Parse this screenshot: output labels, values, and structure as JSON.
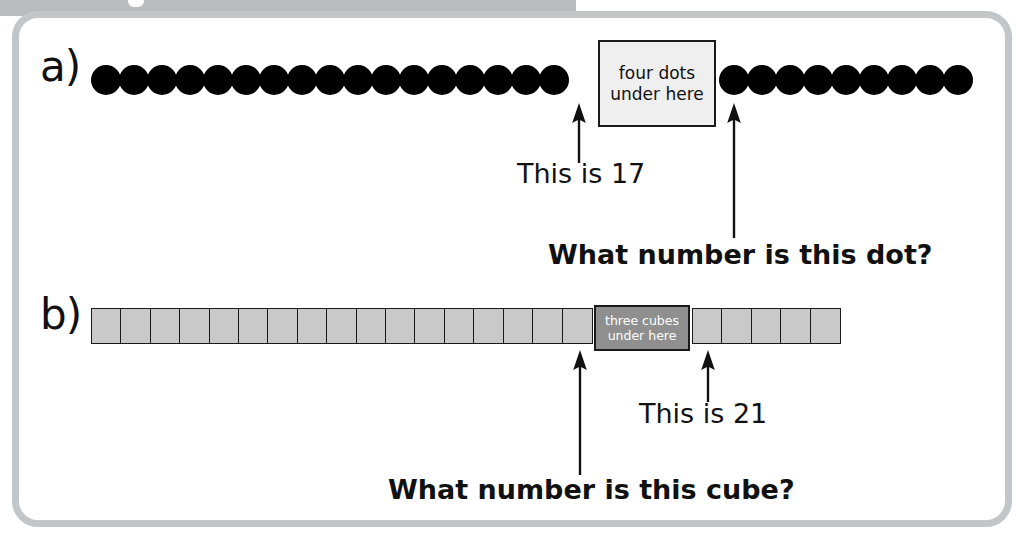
{
  "page": {
    "background_color": "#ffffff",
    "frame_border_color": "#c3c6c8",
    "top_band_color": "#b9bcbe"
  },
  "parts": {
    "a": {
      "label": "a)",
      "manipulative": "dots",
      "dot_color": "#000000",
      "dots_before_cover": 17,
      "dots_after_cover": 9,
      "cover": {
        "line1": "four dots",
        "line2": "under here",
        "hidden_count": 4,
        "fill_color": "#efefef",
        "text_color": "#111111"
      },
      "annotations": [
        {
          "name": "known-marker",
          "text": "This is 17",
          "value": 17,
          "bold": false
        },
        {
          "name": "question",
          "text": "What number is this dot?",
          "bold": true
        }
      ]
    },
    "b": {
      "label": "b)",
      "manipulative": "cubes",
      "cube_fill_color": "#c9c9c9",
      "cube_border_color": "#1a1a1a",
      "cubes_before_cover": 17,
      "cubes_after_cover": 5,
      "cover": {
        "line1": "three cubes",
        "line2": "under here",
        "hidden_count": 3,
        "fill_color": "#8f8f8f",
        "text_color": "#ffffff"
      },
      "annotations": [
        {
          "name": "known-marker",
          "text": "This is 21",
          "value": 21,
          "bold": false
        },
        {
          "name": "question",
          "text": "What number is this cube?",
          "bold": true
        }
      ]
    }
  },
  "icons": {
    "arrow_up": "arrow-up-icon"
  }
}
